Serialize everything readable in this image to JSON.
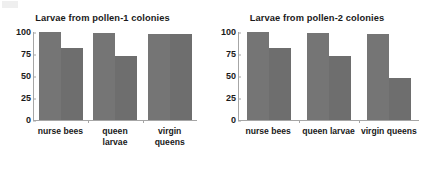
{
  "chart_data": [
    {
      "type": "bar",
      "title": "Larvae from pollen-1 colonies",
      "xlabel": "",
      "ylabel": "",
      "ylim": [
        0,
        100
      ],
      "yticks": [
        100,
        75,
        50,
        25,
        0
      ],
      "grid": false,
      "legend": "none",
      "categories": [
        "nurse bees",
        "queen larvae",
        "virgin queens"
      ],
      "category_lines": [
        [
          "nurse bees"
        ],
        [
          "queen",
          "larvae"
        ],
        [
          "virgin",
          "queens"
        ]
      ],
      "series": [
        {
          "name": "series-1",
          "values": [
            100,
            99,
            98
          ]
        },
        {
          "name": "series-2",
          "values": [
            82,
            73,
            98
          ]
        }
      ],
      "colors": {
        "series1": "#757575",
        "series2": "#6e6e6e",
        "axis": "#a6a6a6"
      }
    },
    {
      "type": "bar",
      "title": "Larvae from pollen-2 colonies",
      "xlabel": "",
      "ylabel": "",
      "ylim": [
        0,
        100
      ],
      "yticks": [
        100,
        75,
        50,
        25,
        0
      ],
      "grid": false,
      "legend": "none",
      "categories": [
        "nurse bees",
        "queen larvae",
        "virgin queens"
      ],
      "category_lines": [
        [
          "nurse bees"
        ],
        [
          "queen larvae"
        ],
        [
          "virgin queens"
        ]
      ],
      "series": [
        {
          "name": "series-1",
          "values": [
            100,
            99,
            98
          ]
        },
        {
          "name": "series-2",
          "values": [
            82,
            73,
            48
          ]
        }
      ],
      "colors": {
        "series1": "#757575",
        "series2": "#6e6e6e",
        "axis": "#a6a6a6"
      }
    }
  ]
}
